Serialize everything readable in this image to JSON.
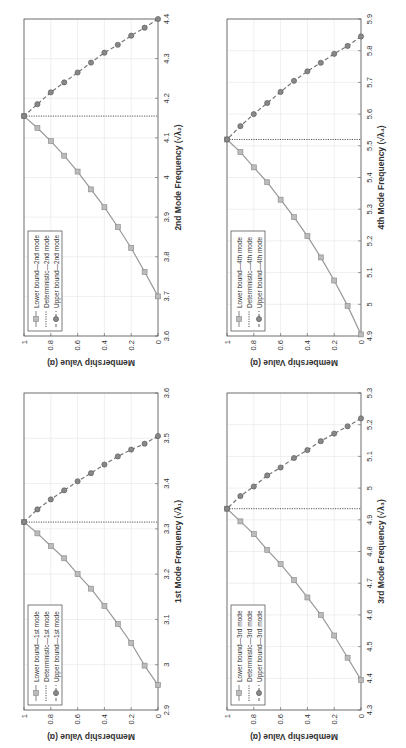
{
  "figure": {
    "rotation_deg": -90
  },
  "colors": {
    "lower": "#999999",
    "deterministic": "#555555",
    "upper": "#777777",
    "grid": "#e4e4e4",
    "axis": "#555555"
  },
  "chart_data": [
    {
      "id": "mode1",
      "type": "line",
      "title": "",
      "xlabel": "1st Mode Frequency (√λ₁)",
      "ylabel": "Membership Value (α)",
      "xlim": [
        2.9,
        3.6
      ],
      "ylim": [
        0,
        1
      ],
      "xticks": [
        "2.9",
        "3",
        "3.1",
        "3.2",
        "3.3",
        "3.4",
        "3.5",
        "3.6"
      ],
      "yticks": [
        "0",
        "0.2",
        "0.4",
        "0.6",
        "0.8",
        "1"
      ],
      "grid": true,
      "legend_position": "upper left",
      "legend": [
        "Lower bound—1st mode",
        "Deterministic—1st mode",
        "Upper bound—1st mode"
      ],
      "alpha": [
        0,
        0.1,
        0.2,
        0.3,
        0.4,
        0.5,
        0.6,
        0.7,
        0.8,
        0.9,
        1.0
      ],
      "series": [
        {
          "name": "Lower bound—1st mode",
          "style": "solid-square",
          "x": [
            2.955,
            2.998,
            3.048,
            3.09,
            3.13,
            3.168,
            3.2,
            3.235,
            3.262,
            3.29,
            3.315
          ]
        },
        {
          "name": "Deterministic—1st mode",
          "style": "dotted",
          "x": [
            3.315,
            3.315
          ]
        },
        {
          "name": "Upper bound—1st mode",
          "style": "dashed-circle",
          "x": [
            3.505,
            3.488,
            3.475,
            3.46,
            3.442,
            3.423,
            3.405,
            3.385,
            3.365,
            3.343,
            3.315
          ]
        }
      ]
    },
    {
      "id": "mode2",
      "type": "line",
      "title": "",
      "xlabel": "2nd Mode Frequency (√λ₂)",
      "ylabel": "Membership Value (α)",
      "xlim": [
        3.6,
        4.4
      ],
      "ylim": [
        0,
        1
      ],
      "xticks": [
        "3.6",
        "3.7",
        "3.8",
        "3.9",
        "4",
        "4.1",
        "4.2",
        "4.3",
        "4.4"
      ],
      "yticks": [
        "0",
        "0.2",
        "0.4",
        "0.6",
        "0.8",
        "1"
      ],
      "grid": true,
      "legend_position": "upper left",
      "legend": [
        "Lower bound—2nd mode",
        "Deterministic—2nd mode",
        "Upper bound—2nd mode"
      ],
      "alpha": [
        0,
        0.1,
        0.2,
        0.3,
        0.4,
        0.5,
        0.6,
        0.7,
        0.8,
        0.9,
        1.0
      ],
      "series": [
        {
          "name": "Lower bound—2nd mode",
          "style": "solid-square",
          "x": [
            3.7,
            3.762,
            3.822,
            3.875,
            3.925,
            3.97,
            4.015,
            4.055,
            4.092,
            4.125,
            4.155
          ]
        },
        {
          "name": "Deterministic—2nd mode",
          "style": "dotted",
          "x": [
            4.155,
            4.155
          ]
        },
        {
          "name": "Upper bound—2nd mode",
          "style": "dashed-circle",
          "x": [
            4.4,
            4.378,
            4.358,
            4.335,
            4.315,
            4.29,
            4.265,
            4.24,
            4.215,
            4.185,
            4.155
          ]
        }
      ]
    },
    {
      "id": "mode3",
      "type": "line",
      "title": "",
      "xlabel": "3rd Mode Frequency (√λ₃)",
      "ylabel": "Membership Value (α)",
      "xlim": [
        4.3,
        5.3
      ],
      "ylim": [
        0,
        1
      ],
      "xticks": [
        "4.3",
        "4.4",
        "4.5",
        "4.6",
        "4.7",
        "4.8",
        "4.9",
        "5",
        "5.1",
        "5.2",
        "5.3"
      ],
      "yticks": [
        "0",
        "0.2",
        "0.4",
        "0.6",
        "0.8",
        "1"
      ],
      "grid": true,
      "legend_position": "upper left",
      "legend": [
        "Lower bound—3rd mode",
        "Deterministic—3rd mode",
        "Upper bound—3rd mode"
      ],
      "alpha": [
        0,
        0.1,
        0.2,
        0.3,
        0.4,
        0.5,
        0.6,
        0.7,
        0.8,
        0.9,
        1.0
      ],
      "series": [
        {
          "name": "Lower bound—3rd mode",
          "style": "solid-square",
          "x": [
            4.395,
            4.465,
            4.535,
            4.6,
            4.655,
            4.71,
            4.76,
            4.805,
            4.855,
            4.895,
            4.935
          ]
        },
        {
          "name": "Deterministic—3rd mode",
          "style": "dotted",
          "x": [
            4.935,
            4.935
          ]
        },
        {
          "name": "Upper bound—3rd mode",
          "style": "dashed-circle",
          "x": [
            5.22,
            5.195,
            5.172,
            5.148,
            5.12,
            5.095,
            5.065,
            5.04,
            5.005,
            4.975,
            4.935
          ]
        }
      ]
    },
    {
      "id": "mode4",
      "type": "line",
      "title": "",
      "xlabel": "4th Mode Frequency (√λ₄)",
      "ylabel": "Membership Value (α)",
      "xlim": [
        4.9,
        5.9
      ],
      "ylim": [
        0,
        1
      ],
      "xticks": [
        "4.9",
        "5",
        "5.1",
        "5.2",
        "5.3",
        "5.4",
        "5.5",
        "5.6",
        "5.7",
        "5.8",
        "5.9"
      ],
      "yticks": [
        "0",
        "0.2",
        "0.4",
        "0.6",
        "0.8",
        "1"
      ],
      "grid": true,
      "legend_position": "upper left",
      "legend": [
        "Lower bound—4th mode",
        "Deterministic—4th mode",
        "Upper bound—4th mode"
      ],
      "alpha": [
        0,
        0.1,
        0.2,
        0.3,
        0.4,
        0.5,
        0.6,
        0.7,
        0.8,
        0.9,
        1.0
      ],
      "series": [
        {
          "name": "Lower bound—4th mode",
          "style": "solid-square",
          "x": [
            4.905,
            4.995,
            5.075,
            5.148,
            5.215,
            5.275,
            5.33,
            5.385,
            5.432,
            5.48,
            5.52
          ]
        },
        {
          "name": "Deterministic—4th mode",
          "style": "dotted",
          "x": [
            5.52,
            5.52
          ]
        },
        {
          "name": "Upper bound—4th mode",
          "style": "dashed-circle",
          "x": [
            5.845,
            5.815,
            5.79,
            5.762,
            5.735,
            5.705,
            5.67,
            5.635,
            5.6,
            5.562,
            5.52
          ]
        }
      ]
    }
  ],
  "layout": [
    {
      "chart": 1,
      "left": 0,
      "top": 0
    },
    {
      "chart": 3,
      "left": 203,
      "top": 0
    },
    {
      "chart": 0,
      "left": 0,
      "top": 374
    },
    {
      "chart": 2,
      "left": 203,
      "top": 374
    }
  ]
}
